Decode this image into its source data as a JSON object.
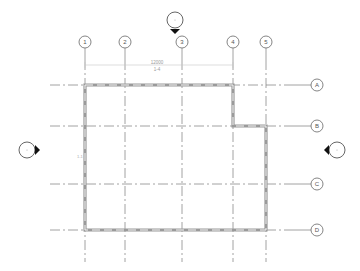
{
  "drawing": {
    "type": "floor-plan-grid",
    "background": "#ffffff",
    "colors": {
      "grid": "#8a8a8a",
      "wall": "#9a9a9a",
      "bubble_stroke": "#666666",
      "elevation_arrow": "#111111"
    }
  },
  "grid_columns": [
    {
      "label": "1",
      "x": 85
    },
    {
      "label": "2",
      "x": 125
    },
    {
      "label": "3",
      "x": 182
    },
    {
      "label": "4",
      "x": 233
    },
    {
      "label": "5",
      "x": 266
    }
  ],
  "grid_rows": [
    {
      "label": "A",
      "y": 85
    },
    {
      "label": "B",
      "y": 126
    },
    {
      "label": "C",
      "y": 184
    },
    {
      "label": "D",
      "y": 230
    }
  ],
  "dimension": {
    "value": "12000",
    "sub_label": "1-4"
  },
  "side_label": "1-1",
  "elevation_markers": [
    {
      "name": "north",
      "direction": "down"
    },
    {
      "name": "west",
      "direction": "right"
    },
    {
      "name": "east",
      "direction": "left"
    }
  ]
}
